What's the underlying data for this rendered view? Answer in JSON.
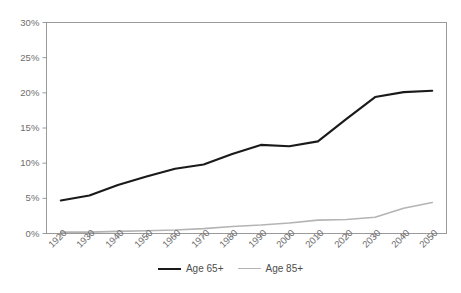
{
  "chart_data": {
    "type": "line",
    "title": "",
    "subtitle": "",
    "xlabel": "",
    "ylabel": "",
    "categories": [
      "1920",
      "1930",
      "1940",
      "1950",
      "1960",
      "1970",
      "1980",
      "1990",
      "2000",
      "2010",
      "2020",
      "2030",
      "2040",
      "2050"
    ],
    "series": [
      {
        "name": "Age 65+",
        "color": "#1a1a1a",
        "values": [
          4.7,
          5.4,
          6.9,
          8.1,
          9.2,
          9.8,
          11.3,
          12.6,
          12.4,
          13.1,
          16.3,
          19.4,
          20.1,
          20.3
        ]
      },
      {
        "name": "Age 85+",
        "color": "#b4b4b4",
        "values": [
          0.2,
          0.2,
          0.3,
          0.4,
          0.5,
          0.7,
          1.0,
          1.2,
          1.5,
          1.9,
          2.0,
          2.3,
          3.6,
          4.4
        ]
      }
    ],
    "ylim": [
      0,
      30
    ],
    "yticks": [
      0,
      5,
      10,
      15,
      20,
      25,
      30
    ],
    "ytick_labels": [
      "0%",
      "5%",
      "10%",
      "15%",
      "20%",
      "25%",
      "30%"
    ],
    "grid": false,
    "legend_position": "bottom",
    "axis_color": "#9a9a9a",
    "tick_label_color": "#6e6e6e"
  },
  "legend": {
    "items": [
      {
        "label": "Age 65+"
      },
      {
        "label": "Age 85+"
      }
    ]
  }
}
